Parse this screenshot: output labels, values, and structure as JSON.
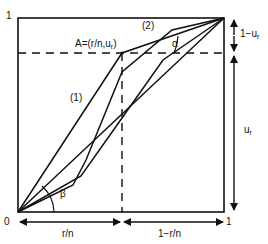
{
  "axes": {
    "y_top": "1",
    "origin": "0",
    "x_right": "1"
  },
  "labels": {
    "point_a": "A=(r/n,u",
    "point_a_sub": "r",
    "point_a_close": ")",
    "curve1": "(1)",
    "curve2": "(2)",
    "alpha": "α",
    "beta": "β",
    "one_minus_u": "1−u",
    "one_minus_u_sub": "r",
    "u": "u",
    "u_sub": "r",
    "r_over_n": "r/n",
    "one_minus_r_over_n": "1−r/n"
  },
  "colors": {
    "line": "#111111",
    "background": "#ffffff"
  }
}
